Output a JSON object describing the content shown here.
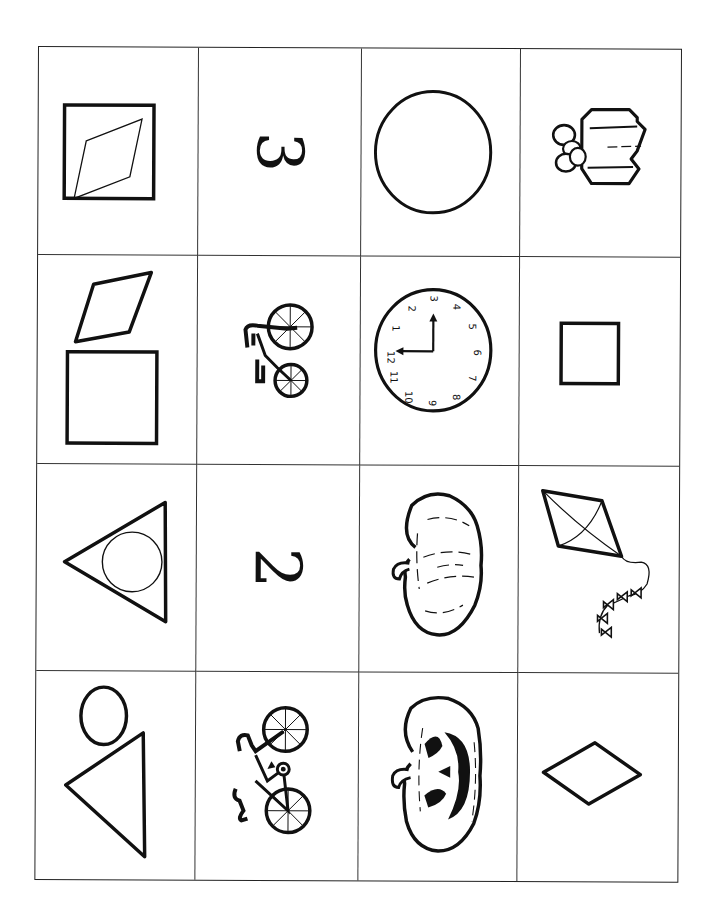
{
  "worksheet": {
    "type": "picture-card grid",
    "rows": 4,
    "columns": 4,
    "line_color": "#222222",
    "background": "#ffffff",
    "cards": [
      {
        "row": 1,
        "col": 1,
        "name": "rhombus-in-square",
        "label": "rhombus inside square"
      },
      {
        "row": 1,
        "col": 2,
        "name": "number-three",
        "label": "3"
      },
      {
        "row": 1,
        "col": 3,
        "name": "circle",
        "label": "circle"
      },
      {
        "row": 1,
        "col": 4,
        "name": "gift-box",
        "label": "wrapped gift with bow"
      },
      {
        "row": 2,
        "col": 1,
        "name": "rhombus-and-square",
        "label": "rhombus above square"
      },
      {
        "row": 2,
        "col": 2,
        "name": "small-bicycle",
        "label": "bicycle"
      },
      {
        "row": 2,
        "col": 3,
        "name": "clock",
        "label": "clock showing 3:00",
        "clock_numbers": [
          "12",
          "1",
          "2",
          "3",
          "4",
          "5",
          "6",
          "7",
          "8",
          "9",
          "10",
          "11"
        ]
      },
      {
        "row": 2,
        "col": 4,
        "name": "small-square",
        "label": "square"
      },
      {
        "row": 3,
        "col": 1,
        "name": "circle-in-triangle",
        "label": "circle inside triangle"
      },
      {
        "row": 3,
        "col": 2,
        "name": "number-two",
        "label": "2"
      },
      {
        "row": 3,
        "col": 3,
        "name": "pumpkin",
        "label": "pumpkin"
      },
      {
        "row": 3,
        "col": 4,
        "name": "kite",
        "label": "kite with bow tail"
      },
      {
        "row": 4,
        "col": 1,
        "name": "circle-and-triangle",
        "label": "circle above triangle"
      },
      {
        "row": 4,
        "col": 2,
        "name": "bicycle",
        "label": "bicycle"
      },
      {
        "row": 4,
        "col": 3,
        "name": "jack-o-lantern",
        "label": "jack-o'-lantern"
      },
      {
        "row": 4,
        "col": 4,
        "name": "diamond",
        "label": "diamond"
      }
    ]
  }
}
